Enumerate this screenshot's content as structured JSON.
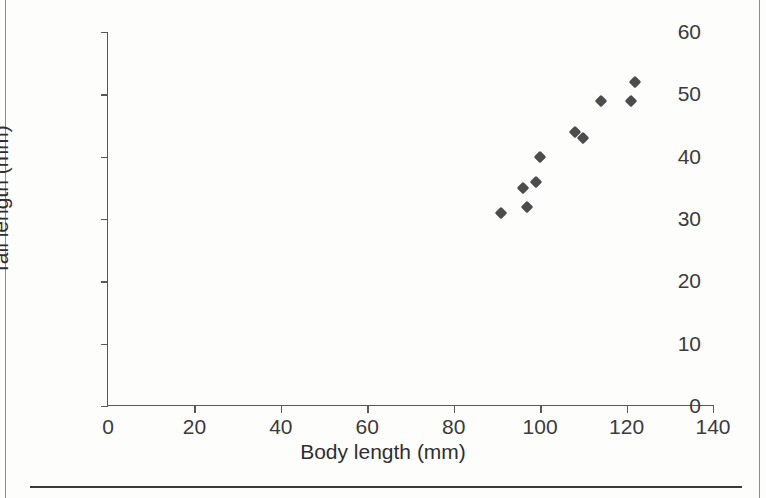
{
  "chart_data": {
    "type": "scatter",
    "title": "",
    "xlabel": "Body length (mm)",
    "ylabel": "Tail length (mm)",
    "xlim": [
      0,
      140
    ],
    "ylim": [
      0,
      60
    ],
    "xticks": [
      0,
      20,
      40,
      60,
      80,
      100,
      120,
      140
    ],
    "yticks": [
      0,
      10,
      20,
      30,
      40,
      50,
      60
    ],
    "grid": false,
    "legend": false,
    "marker": "diamond",
    "marker_color": "#4c4b4d",
    "points": [
      {
        "x": 91,
        "y": 31
      },
      {
        "x": 96,
        "y": 35
      },
      {
        "x": 97,
        "y": 32
      },
      {
        "x": 99,
        "y": 36
      },
      {
        "x": 100,
        "y": 40
      },
      {
        "x": 108,
        "y": 44
      },
      {
        "x": 110,
        "y": 43
      },
      {
        "x": 114,
        "y": 49
      },
      {
        "x": 121,
        "y": 49
      },
      {
        "x": 122,
        "y": 52
      }
    ]
  },
  "page": {
    "bleed_text_left": "",
    "bleed_text_right": ""
  }
}
